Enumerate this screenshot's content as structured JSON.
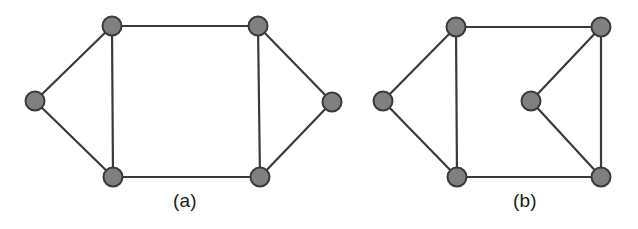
{
  "figure": {
    "background_color": "#ffffff",
    "edge_color": "#3a3a3a",
    "edge_width": 2.2,
    "node_fill_color": "#808080",
    "node_stroke_color": "#3a3a3a",
    "node_stroke_width": 2.0,
    "node_radius": 9.5,
    "caption_color": "#1a1a1a"
  },
  "panels": [
    {
      "id": "panel-a",
      "caption": "(a)",
      "caption_x": 185,
      "caption_y": 205,
      "nodes": [
        {
          "id": "a-left",
          "name": "node-a-left",
          "x": 35,
          "y": 101
        },
        {
          "id": "a-top-left",
          "name": "node-a-top-left",
          "x": 112,
          "y": 26
        },
        {
          "id": "a-top-right",
          "name": "node-a-top-right",
          "x": 258,
          "y": 26
        },
        {
          "id": "a-right",
          "name": "node-a-right",
          "x": 332,
          "y": 102
        },
        {
          "id": "a-bottom-left",
          "name": "node-a-bottom-left",
          "x": 113,
          "y": 177
        },
        {
          "id": "a-bottom-right",
          "name": "node-a-bottom-right",
          "x": 260,
          "y": 177
        }
      ],
      "edges": [
        {
          "from": "a-left",
          "to": "a-top-left"
        },
        {
          "from": "a-left",
          "to": "a-bottom-left"
        },
        {
          "from": "a-top-left",
          "to": "a-top-right"
        },
        {
          "from": "a-top-left",
          "to": "a-bottom-left"
        },
        {
          "from": "a-top-right",
          "to": "a-right"
        },
        {
          "from": "a-top-right",
          "to": "a-bottom-right"
        },
        {
          "from": "a-right",
          "to": "a-bottom-right"
        },
        {
          "from": "a-bottom-left",
          "to": "a-bottom-right"
        }
      ]
    },
    {
      "id": "panel-b",
      "caption": "(b)",
      "caption_x": 525,
      "caption_y": 205,
      "nodes": [
        {
          "id": "b-left",
          "name": "node-b-left",
          "x": 383,
          "y": 101
        },
        {
          "id": "b-top-left",
          "name": "node-b-top-left",
          "x": 456,
          "y": 27
        },
        {
          "id": "b-top-right",
          "name": "node-b-top-right",
          "x": 601,
          "y": 27
        },
        {
          "id": "b-middle",
          "name": "node-b-middle",
          "x": 531,
          "y": 101
        },
        {
          "id": "b-bottom-left",
          "name": "node-b-bottom-left",
          "x": 457,
          "y": 177
        },
        {
          "id": "b-bottom-right",
          "name": "node-b-bottom-right",
          "x": 601,
          "y": 177
        }
      ],
      "edges": [
        {
          "from": "b-left",
          "to": "b-top-left"
        },
        {
          "from": "b-left",
          "to": "b-bottom-left"
        },
        {
          "from": "b-top-left",
          "to": "b-top-right"
        },
        {
          "from": "b-top-left",
          "to": "b-bottom-left"
        },
        {
          "from": "b-top-right",
          "to": "b-middle"
        },
        {
          "from": "b-top-right",
          "to": "b-bottom-right"
        },
        {
          "from": "b-middle",
          "to": "b-bottom-right"
        },
        {
          "from": "b-bottom-left",
          "to": "b-bottom-right"
        }
      ]
    }
  ]
}
